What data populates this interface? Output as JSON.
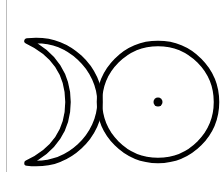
{
  "symbol": {
    "name": "moon-and-sun-symbol",
    "stroke_color": "#000000",
    "background": "#ffffff",
    "edge_line_color": "#bdbdbd",
    "sun": {
      "cx": 158,
      "cy": 102,
      "r": 61,
      "dot_r": 4.5
    },
    "crescent": {
      "top_tip": [
        27,
        41
      ],
      "bottom_tip": [
        27,
        163
      ]
    }
  }
}
